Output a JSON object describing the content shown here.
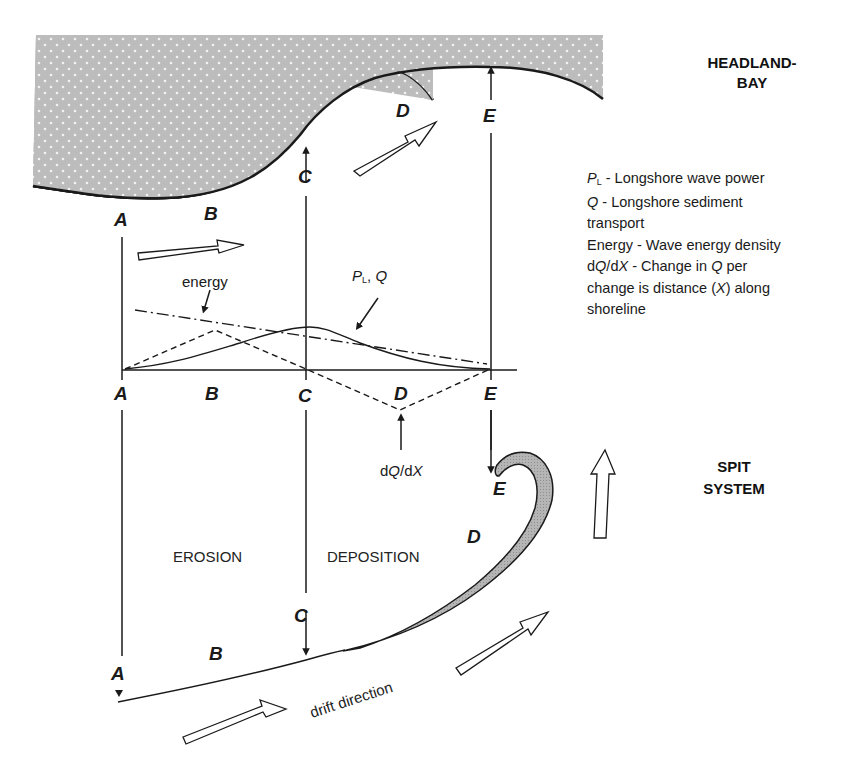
{
  "diagram": {
    "titles": {
      "headland_bay_line1": "HEADLAND-",
      "headland_bay_line2": "BAY",
      "spit_system_line1": "SPIT",
      "spit_system_line2": "SYSTEM"
    },
    "point_labels": {
      "top_A": "A",
      "top_B": "B",
      "top_C": "C",
      "top_D": "D",
      "top_E": "E",
      "axis_A": "A",
      "axis_B": "B",
      "axis_C": "C",
      "axis_D": "D",
      "axis_E": "E",
      "spit_A": "A",
      "spit_B": "B",
      "spit_C": "C",
      "spit_D": "D",
      "spit_E": "E"
    },
    "graph": {
      "energy_label": "energy",
      "pl_q_label_P": "P",
      "pl_q_label_sub": "L",
      "pl_q_label_rest": ", ",
      "pl_q_label_Q": "Q",
      "dqdx_d1": "d",
      "dqdx_Q": "Q",
      "dqdx_mid": "/d",
      "dqdx_X": "X"
    },
    "regions": {
      "erosion": "EROSION",
      "deposition": "DEPOSITION",
      "drift": "drift direction"
    },
    "legend": {
      "pl_symbol": "P",
      "pl_sub": "L",
      "pl_text": " - Longshore wave power",
      "q_symbol": "Q",
      "q_text": " - Longshore sediment",
      "q_text2": "transport",
      "energy_text": "Energy - Wave energy density",
      "dqdx_d": "d",
      "dqdx_Q": "Q",
      "dqdx_slash": "/d",
      "dqdx_X": "X",
      "dqdx_text": " - Change in ",
      "dqdx_Q2": "Q",
      "dqdx_text2": " per",
      "dqdx_line2a": "change is distance (",
      "dqdx_line2X": "X",
      "dqdx_line2b": ") along",
      "dqdx_line3": "shoreline"
    },
    "colors": {
      "land_fill": "#bdbdbd",
      "spit_fill": "#b3b3b3",
      "line": "#1a1a1a"
    }
  }
}
